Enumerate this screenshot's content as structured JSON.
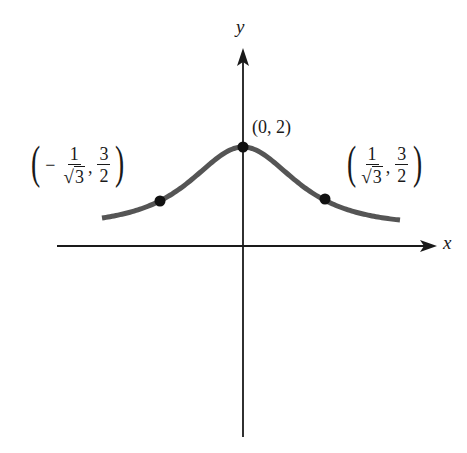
{
  "chart_data": {
    "type": "line",
    "title": "",
    "function": "y = 2/(1+x^2)",
    "xlabel": "x",
    "ylabel": "y",
    "grid": false,
    "legend": null,
    "ticks": {
      "x": [],
      "y": []
    },
    "x": [
      -1.0,
      -0.8,
      -0.577,
      -0.4,
      -0.2,
      0,
      0.2,
      0.4,
      0.577,
      0.8,
      1.0
    ],
    "series": [
      {
        "name": "curve",
        "values": [
          1.0,
          1.22,
          1.5,
          1.72,
          1.92,
          2.0,
          1.92,
          1.72,
          1.5,
          1.22,
          1.0
        ]
      }
    ],
    "points": [
      {
        "x": 0,
        "y": 2,
        "label": "(0, 2)"
      },
      {
        "x": -0.577,
        "y": 1.5,
        "label": "(-1/√3, 3/2)"
      },
      {
        "x": 0.577,
        "y": 1.5,
        "label": "(1/√3, 3/2)"
      }
    ],
    "annotations": [
      "(0, 2)",
      "(-1/√3, 3/2)",
      "(1/√3, 3/2)"
    ]
  },
  "axes": {
    "x_label": "x",
    "y_label": "y"
  },
  "labels": {
    "peak": "(0, 2)",
    "left": {
      "open": "(",
      "sign": "−",
      "num": "1",
      "den_sqrt": "√",
      "den_arg": "3",
      "comma": ",",
      "num2": "3",
      "den2": "2",
      "close": ")"
    },
    "right": {
      "open": "(",
      "num": "1",
      "den_sqrt": "√",
      "den_arg": "3",
      "comma": ",",
      "num2": "3",
      "den2": "2",
      "close": ")"
    }
  },
  "colors": {
    "axis": "#1a1a1a",
    "curve": "#555555",
    "point": "#111111",
    "background": "#ffffff"
  }
}
